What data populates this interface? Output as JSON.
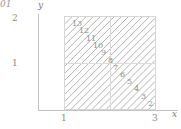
{
  "figure": {
    "corner_text": "01",
    "background_color": "#ffffff",
    "line_color": "#a8a8a8",
    "axis_color": "#c3c3c3",
    "text_color": "#8a8a8a"
  },
  "axes": {
    "x_label": "x",
    "y_label": "y",
    "x_ticks": [
      "1",
      "3"
    ],
    "y_ticks": [
      "2",
      "1"
    ],
    "x_range": [
      0,
      3.4
    ],
    "y_range": [
      0,
      2.2
    ],
    "grid": true
  },
  "chart_data": {
    "type": "line",
    "title": "",
    "xlabel": "x",
    "ylabel": "y",
    "xlim": [
      0,
      3.4
    ],
    "ylim": [
      0,
      2.2
    ],
    "grid": true,
    "region": {
      "x_start": 1,
      "x_end": 3,
      "y_start": 0,
      "y_end": 2,
      "gridlines_x": [
        2
      ],
      "gridlines_y": [
        1
      ]
    },
    "series_note": "family of parallel diagonal lines of slope 1 clipped to the square [1,3]x[0,2], labelled 13 (upper-left) down to 1 (lower-right)",
    "line_labels": [
      "13",
      "12",
      "11",
      "10",
      "9",
      "8",
      "7",
      "6",
      "5",
      "4",
      "3",
      "2",
      "1"
    ],
    "line_label_positions": [
      {
        "label": "13",
        "x": 7,
        "y": 3
      },
      {
        "label": "12",
        "x": 14,
        "y": 10
      },
      {
        "label": "11",
        "x": 21,
        "y": 18
      },
      {
        "label": "10",
        "x": 28,
        "y": 25
      },
      {
        "label": "9",
        "x": 36,
        "y": 32
      },
      {
        "label": "8",
        "x": 43,
        "y": 40
      },
      {
        "label": "7",
        "x": 48,
        "y": 47
      },
      {
        "label": "6",
        "x": 55,
        "y": 54
      },
      {
        "label": "5",
        "x": 62,
        "y": 61
      },
      {
        "label": "4",
        "x": 69,
        "y": 68
      },
      {
        "label": "3",
        "x": 76,
        "y": 76
      },
      {
        "label": "2",
        "x": 83,
        "y": 83
      },
      {
        "label": "1",
        "x": 90,
        "y": 90
      }
    ]
  }
}
